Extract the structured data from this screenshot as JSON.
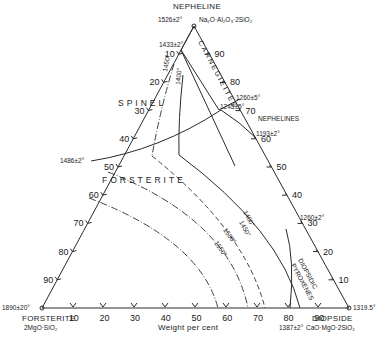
{
  "diagram": {
    "vertices": {
      "top": {
        "name": "NEPHELINE",
        "formula": "Na2O·Al2O3·2SiO2",
        "formula_display": "Na₂O·Al₂O₃·2SiO₂",
        "temp": "1526±2°"
      },
      "left": {
        "name": "FORSTERITE",
        "formula_display": "2MgO·SiO₂",
        "temp": "1890±20°"
      },
      "right": {
        "name": "DIOPSIDE",
        "formula_display": "CaO·MgO·2SiO₂",
        "temp": "1319.5°"
      }
    },
    "axis_label": "Weight per cent",
    "bottom_ticks": [
      "10",
      "20",
      "30",
      "40",
      "50",
      "60",
      "70",
      "80",
      "90"
    ],
    "left_ticks": [
      "10",
      "20",
      "30",
      "40",
      "50",
      "60",
      "70",
      "80",
      "90"
    ],
    "right_ticks": [
      "10",
      "20",
      "30",
      "40",
      "50",
      "60",
      "70",
      "80",
      "90"
    ],
    "fields": {
      "spinel": "SPINEL",
      "forsterite": "FORSTERITE",
      "carnegieites": "CARNEGIEITES",
      "nephelines": "NEPHELINES",
      "diopside_pyroxenes_1": "DIOPSIDIC",
      "diopside_pyroxenes_2": "PYROXENES"
    },
    "points": {
      "p1433": "1433±2°",
      "p1486": "1486±2°",
      "p1260a": "1260±5°",
      "p1245": "1245±5°",
      "p1193": "1193±2°",
      "p1260b": "1260±2°",
      "p1387": "1387±2°"
    },
    "isotherms": [
      "1400°",
      "1450°",
      "1500°",
      "1550°"
    ],
    "spinel_isotherms": [
      "1450°",
      "1400°"
    ]
  }
}
